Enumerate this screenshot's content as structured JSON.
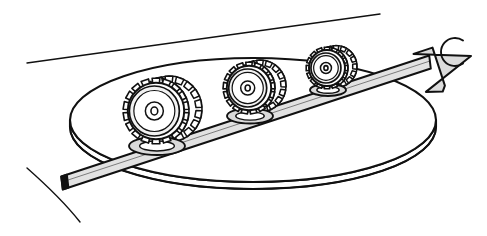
{
  "figure": {
    "domain_note": "black-and-white technical line illustration",
    "background_color": "#ffffff",
    "ink_color": "#111111",
    "band_fill": "#e2e2e2",
    "arrow_fill": "#dcdcdc",
    "hub_fill": "#d9d9d9",
    "gear_face_fill": "#f2f2f2",
    "shadow_color": "#1a1a1a",
    "canvas": {
      "width": 487,
      "height": 236
    }
  },
  "scene": {
    "disc": {
      "name": "large-ellipse-disc",
      "center_x": 253,
      "center_y": 120,
      "radius_x": 183,
      "radius_y": 62,
      "rim_thickness": 7,
      "stroke_width": 2.1
    },
    "top_line": {
      "name": "upper-diagonal-edge",
      "x1": 27,
      "y1": 63,
      "x2": 380,
      "y2": 14,
      "stroke_width": 1.4
    },
    "corner_arc_bottom_left": {
      "name": "bottom-left-arc",
      "start_x": 27,
      "start_y": 168,
      "end_x": 80,
      "end_y": 222,
      "stroke_width": 1.4
    },
    "corner_arc_top_right": {
      "name": "top-right-c-arc",
      "center_x": 455,
      "center_y": 52,
      "radius": 14,
      "stroke_width": 1.9
    },
    "band": {
      "name": "straight-band-strip",
      "start_x": 62,
      "start_y": 183,
      "end_x": 430,
      "end_y": 62,
      "width": 13,
      "stroke_width": 2.0
    },
    "arrow": {
      "name": "band-arrowhead",
      "tip_x": 471,
      "tip_y": 56,
      "direction": "up-right",
      "stroke_width": 2.0
    },
    "gears": [
      {
        "name": "gear-wheel-large",
        "index": 1,
        "center_x": 156,
        "center_y": 111,
        "outer_radius": 33,
        "face_radius": 25,
        "hub_radius": 9,
        "axle_radius": 4,
        "tooth_count": 18,
        "tooth_depth": 6,
        "depth_offset_x": 13,
        "depth_offset_y": -2,
        "base_center_x": 157,
        "base_center_y": 146,
        "base_radius_x": 28,
        "base_radius_y": 9
      },
      {
        "name": "gear-wheel-medium",
        "index": 2,
        "center_x": 249,
        "center_y": 88,
        "outer_radius": 26,
        "face_radius": 19,
        "hub_radius": 7,
        "axle_radius": 3,
        "tooth_count": 17,
        "tooth_depth": 5,
        "depth_offset_x": 11,
        "depth_offset_y": -2,
        "base_center_x": 250,
        "base_center_y": 116,
        "base_radius_x": 23,
        "base_radius_y": 7.5
      },
      {
        "name": "gear-wheel-small",
        "index": 3,
        "center_x": 327,
        "center_y": 68,
        "outer_radius": 21,
        "face_radius": 15,
        "hub_radius": 5.5,
        "axle_radius": 2.4,
        "tooth_count": 16,
        "tooth_depth": 4.2,
        "depth_offset_x": 9,
        "depth_offset_y": -1.5,
        "base_center_x": 328,
        "base_center_y": 90,
        "base_radius_x": 18,
        "base_radius_y": 6
      }
    ]
  },
  "labels": {
    "visible_text": ""
  }
}
